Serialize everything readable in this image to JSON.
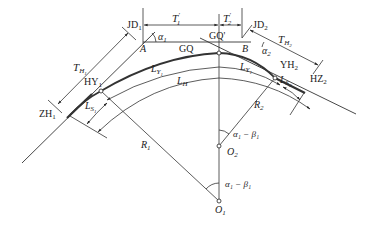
{
  "diagram": {
    "points": {
      "JD1": {
        "main": "JD",
        "sub": "1"
      },
      "JD2": {
        "main": "JD",
        "sub": "2"
      },
      "A": "A",
      "B": "B",
      "GQ": "GQ",
      "GQ_prime": "GQ'",
      "HY1": {
        "main": "HY",
        "sub": "1"
      },
      "YH2": {
        "main": "YH",
        "sub": "2"
      },
      "ZH1": {
        "main": "ZH",
        "sub": "1"
      },
      "HZ2": {
        "main": "HZ",
        "sub": "2"
      },
      "O1": {
        "main": "O",
        "sub": "1"
      },
      "O2": {
        "main": "O",
        "sub": "2"
      }
    },
    "dimensions": {
      "T1_prime": {
        "main": "T",
        "sub": "1",
        "sup": "′"
      },
      "T2_prime": {
        "main": "T",
        "sub": "2",
        "sup": "′"
      },
      "TH1": {
        "main": "T",
        "sub": "H",
        "subsub": "1"
      },
      "TH2": {
        "main": "T",
        "sub": "H",
        "subsub": "2"
      },
      "LY1_left": {
        "main": "L",
        "sub": "Y",
        "subsub": "1"
      },
      "LY1_right": {
        "main": "L",
        "sub": "Y",
        "subsub": "1"
      },
      "LH": {
        "main": "L",
        "sub": "H"
      },
      "LS1": {
        "main": "L",
        "sub": "S",
        "subsub": "1"
      },
      "LS2": {
        "main": "L",
        "sub": "S",
        "subsub": "2"
      },
      "R1": {
        "main": "R",
        "sub": "1"
      },
      "R2": {
        "main": "R",
        "sub": "2"
      }
    },
    "angles": {
      "alpha1": {
        "main": "α",
        "sub": "1"
      },
      "alpha2": {
        "main": "α",
        "sub": "2"
      },
      "upper": "α₁ − β₁",
      "lower": "α₁ − β₁"
    }
  }
}
